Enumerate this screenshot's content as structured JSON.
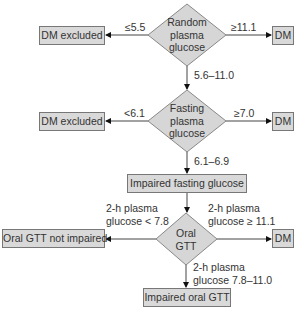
{
  "diagram": {
    "type": "flowchart",
    "decisions": {
      "random": {
        "label_lines": [
          "Random",
          "plasma",
          "glucose"
        ]
      },
      "fasting": {
        "label_lines": [
          "Fasting",
          "plasma",
          "glucose"
        ]
      },
      "oral": {
        "label_lines": [
          "Oral",
          "GTT"
        ]
      }
    },
    "outcomes": {
      "random_left": "DM excluded",
      "random_right": "DM",
      "fasting_left": "DM excluded",
      "fasting_right": "DM",
      "ifg": "Impaired fasting glucose",
      "oral_left": "Oral GTT not impaired",
      "oral_right": "DM",
      "oral_down": "Impaired oral GTT"
    },
    "edges": {
      "random_left": "≤5.5",
      "random_right": "≥11.1",
      "random_down": "5.6–11.0",
      "fasting_left": "<6.1",
      "fasting_right": "≥7.0",
      "fasting_down": "6.1–6.9",
      "oral_left": [
        "2-h plasma",
        "glucose < 7.8"
      ],
      "oral_right": [
        "2-h plasma",
        "glucose ≥ 11.1"
      ],
      "oral_down": [
        "2-h plasma",
        "glucose 7.8–11.0"
      ]
    },
    "colors": {
      "box_fill": "#d9d9d9",
      "diamond_fill": "#d6d6d6",
      "stroke": "#777777",
      "text": "#333333"
    }
  }
}
